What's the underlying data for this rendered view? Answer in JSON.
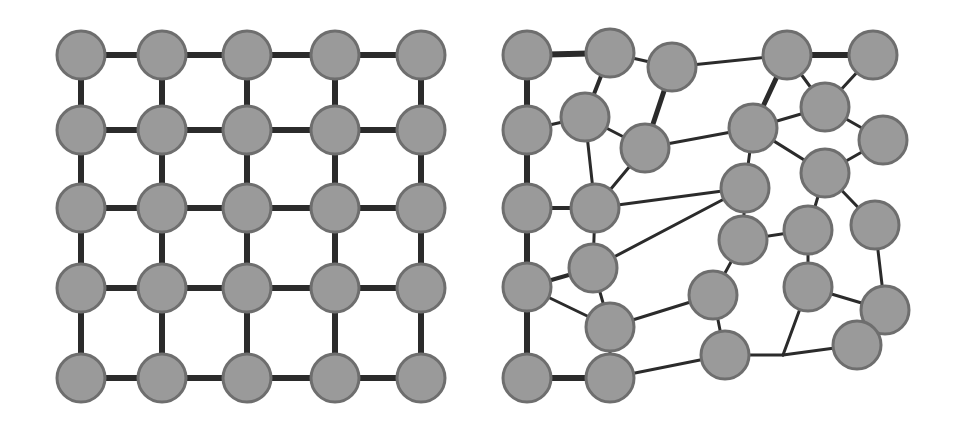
{
  "colors": {
    "node_fill": "#9a9a9a",
    "node_stroke": "#6e6e6e",
    "edge": "#2b2b2b",
    "background": "#ffffff"
  },
  "node_radius": 24,
  "panels": [
    {
      "name": "regular-grid-graph",
      "edge_width": 6,
      "nodes": [
        [
          81,
          55
        ],
        [
          162,
          55
        ],
        [
          247,
          55
        ],
        [
          335,
          55
        ],
        [
          421,
          55
        ],
        [
          81,
          130
        ],
        [
          162,
          130
        ],
        [
          247,
          130
        ],
        [
          335,
          130
        ],
        [
          421,
          130
        ],
        [
          81,
          208
        ],
        [
          162,
          208
        ],
        [
          247,
          208
        ],
        [
          335,
          208
        ],
        [
          421,
          208
        ],
        [
          81,
          288
        ],
        [
          162,
          288
        ],
        [
          247,
          288
        ],
        [
          335,
          288
        ],
        [
          421,
          288
        ],
        [
          81,
          378
        ],
        [
          162,
          378
        ],
        [
          247,
          378
        ],
        [
          335,
          378
        ],
        [
          421,
          378
        ]
      ],
      "edges": [
        [
          0,
          1
        ],
        [
          1,
          2
        ],
        [
          2,
          3
        ],
        [
          3,
          4
        ],
        [
          5,
          6
        ],
        [
          6,
          7
        ],
        [
          7,
          8
        ],
        [
          8,
          9
        ],
        [
          10,
          11
        ],
        [
          11,
          12
        ],
        [
          12,
          13
        ],
        [
          13,
          14
        ],
        [
          15,
          16
        ],
        [
          16,
          17
        ],
        [
          17,
          18
        ],
        [
          18,
          19
        ],
        [
          20,
          21
        ],
        [
          21,
          22
        ],
        [
          22,
          23
        ],
        [
          23,
          24
        ],
        [
          0,
          5
        ],
        [
          5,
          10
        ],
        [
          10,
          15
        ],
        [
          15,
          20
        ],
        [
          1,
          6
        ],
        [
          6,
          11
        ],
        [
          11,
          16
        ],
        [
          16,
          21
        ],
        [
          2,
          7
        ],
        [
          7,
          12
        ],
        [
          12,
          17
        ],
        [
          17,
          22
        ],
        [
          3,
          8
        ],
        [
          8,
          13
        ],
        [
          13,
          18
        ],
        [
          18,
          23
        ],
        [
          4,
          9
        ],
        [
          9,
          14
        ],
        [
          14,
          19
        ],
        [
          19,
          24
        ]
      ]
    },
    {
      "name": "perturbed-irregular-graph",
      "edge_width": 3,
      "nodes": [
        [
          527,
          55
        ],
        [
          610,
          53
        ],
        [
          672,
          67
        ],
        [
          787,
          55
        ],
        [
          873,
          55
        ],
        [
          527,
          130
        ],
        [
          585,
          117
        ],
        [
          645,
          148
        ],
        [
          753,
          128
        ],
        [
          825,
          107
        ],
        [
          883,
          140
        ],
        [
          825,
          173
        ],
        [
          745,
          188
        ],
        [
          527,
          208
        ],
        [
          595,
          208
        ],
        [
          743,
          240
        ],
        [
          808,
          230
        ],
        [
          875,
          225
        ],
        [
          593,
          268
        ],
        [
          527,
          287
        ],
        [
          713,
          295
        ],
        [
          808,
          287
        ],
        [
          885,
          310
        ],
        [
          610,
          327
        ],
        [
          725,
          355
        ],
        [
          857,
          345
        ],
        [
          527,
          378
        ],
        [
          610,
          378
        ]
      ],
      "junctions": [
        [
          783,
          355
        ]
      ],
      "edges": [
        [
          0,
          1,
          6
        ],
        [
          1,
          2,
          3
        ],
        [
          2,
          3,
          3
        ],
        [
          3,
          4,
          6
        ],
        [
          0,
          5,
          6
        ],
        [
          1,
          6,
          4
        ],
        [
          2,
          7,
          5
        ],
        [
          3,
          8,
          5
        ],
        [
          3,
          9,
          3
        ],
        [
          4,
          9,
          3
        ],
        [
          5,
          6,
          3
        ],
        [
          6,
          7,
          3
        ],
        [
          7,
          8,
          3
        ],
        [
          8,
          9,
          3
        ],
        [
          9,
          10,
          3
        ],
        [
          8,
          11,
          3
        ],
        [
          10,
          11,
          3
        ],
        [
          5,
          13,
          6
        ],
        [
          6,
          14,
          3
        ],
        [
          7,
          14,
          3
        ],
        [
          14,
          12,
          3
        ],
        [
          8,
          12,
          3
        ],
        [
          12,
          18,
          3
        ],
        [
          13,
          14,
          4
        ],
        [
          14,
          18,
          3
        ],
        [
          12,
          15,
          3
        ],
        [
          11,
          16,
          3
        ],
        [
          11,
          17,
          3
        ],
        [
          15,
          16,
          3
        ],
        [
          13,
          19,
          6
        ],
        [
          18,
          19,
          4
        ],
        [
          19,
          23,
          3
        ],
        [
          18,
          23,
          3
        ],
        [
          15,
          20,
          3
        ],
        [
          20,
          23,
          3
        ],
        [
          16,
          21,
          3
        ],
        [
          17,
          22,
          3
        ],
        [
          21,
          22,
          3
        ],
        [
          20,
          24,
          3
        ],
        [
          22,
          25,
          3
        ],
        [
          19,
          26,
          6
        ],
        [
          23,
          27,
          3
        ],
        [
          26,
          27,
          6
        ],
        [
          27,
          24,
          3
        ]
      ],
      "junction_edges": [
        [
          24,
          "J0",
          3
        ],
        [
          "J0",
          25,
          3
        ],
        [
          21,
          "J0",
          3
        ]
      ]
    }
  ]
}
